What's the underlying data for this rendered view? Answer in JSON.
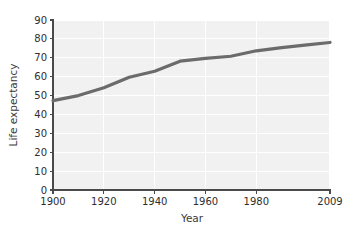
{
  "chart_data": {
    "type": "line",
    "title": "",
    "xlabel": "Year",
    "ylabel": "Life expectancy",
    "xlim": [
      1900,
      2009
    ],
    "ylim": [
      0,
      90
    ],
    "grid": true,
    "legend": "none",
    "x_ticks": [
      "1900",
      "1920",
      "1940",
      "1960",
      "1980",
      "2009"
    ],
    "x_tick_values": [
      1900,
      1920,
      1940,
      1960,
      1980,
      2009
    ],
    "y_ticks": [
      "0",
      "10",
      "20",
      "30",
      "40",
      "50",
      "60",
      "70",
      "80",
      "90"
    ],
    "y_tick_values": [
      0,
      10,
      20,
      30,
      40,
      50,
      60,
      70,
      80,
      90
    ],
    "series": [
      {
        "name": "Life expectancy",
        "color": "#6b6b6b",
        "x": [
          1900,
          1910,
          1920,
          1930,
          1940,
          1950,
          1960,
          1970,
          1980,
          1990,
          2000,
          2009
        ],
        "values": [
          47.3,
          50.0,
          54.1,
          59.7,
          62.9,
          68.2,
          69.7,
          70.8,
          73.7,
          75.4,
          76.8,
          78.1
        ]
      }
    ]
  },
  "axes": {
    "x_title": "Year",
    "y_title": "Life expectancy"
  }
}
